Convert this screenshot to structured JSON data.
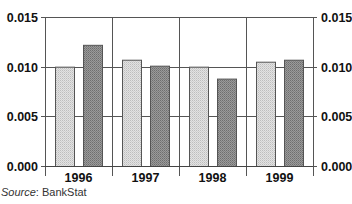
{
  "chart_data": {
    "type": "bar",
    "title": "",
    "xlabel": "",
    "ylabel": "",
    "categories": [
      "1996",
      "1997",
      "1998",
      "1999"
    ],
    "series": [
      {
        "name": "Series 1 (light)",
        "color": "#d4d4d4",
        "values": [
          0.01,
          0.0107,
          0.01,
          0.0105
        ]
      },
      {
        "name": "Series 2 (dark)",
        "color": "#8e8e8e",
        "values": [
          0.0122,
          0.0101,
          0.0088,
          0.0107
        ]
      }
    ],
    "ylim": [
      0,
      0.015
    ],
    "yticks": [
      "0.000",
      "0.005",
      "0.010",
      "0.015"
    ],
    "ytick_values": [
      0,
      0.005,
      0.01,
      0.015
    ],
    "secondary_axis": true,
    "grid": true,
    "legend": "none"
  },
  "source": {
    "label": "Source",
    "text": ": BankStat"
  }
}
